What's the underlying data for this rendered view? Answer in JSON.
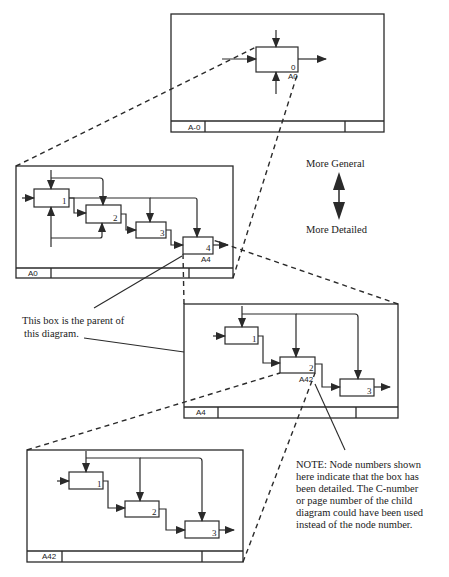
{
  "diagrams": [
    {
      "id": "A-0",
      "node_label": "A-0",
      "boxes": [
        {
          "number": "0",
          "child_ref": "A0"
        }
      ]
    },
    {
      "id": "A0",
      "node_label": "A0",
      "boxes": [
        {
          "number": "1"
        },
        {
          "number": "2"
        },
        {
          "number": "3"
        },
        {
          "number": "4",
          "child_ref": "A4"
        }
      ]
    },
    {
      "id": "A4",
      "node_label": "A4",
      "boxes": [
        {
          "number": "1"
        },
        {
          "number": "2",
          "child_ref": "A42"
        },
        {
          "number": "3"
        }
      ]
    },
    {
      "id": "A42",
      "node_label": "A42",
      "boxes": [
        {
          "number": "1"
        },
        {
          "number": "2"
        },
        {
          "number": "3"
        }
      ]
    }
  ],
  "legend": {
    "top": "More General",
    "bottom": "More Detailed"
  },
  "annotations": {
    "parent_note": [
      "This box is the parent of",
      "this diagram."
    ],
    "node_note": [
      "NOTE:  Node numbers shown",
      "here indicate that the box has",
      "been detailed.  The C-number",
      "or page number of the child",
      "diagram could have been used",
      "instead of the node number."
    ]
  }
}
